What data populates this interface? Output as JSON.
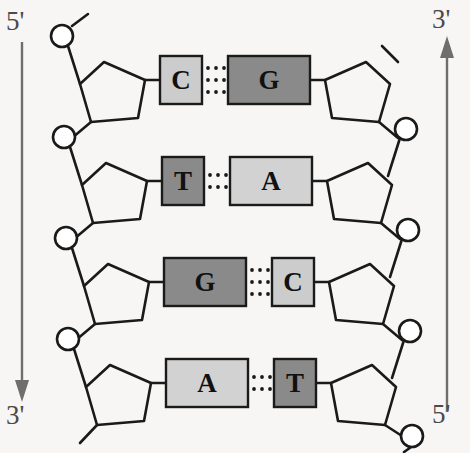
{
  "diagram": {
    "type": "dna-antiparallel-strands",
    "background_color": "#f7f6f4",
    "line_color": "#1a1a1a",
    "arrow_color": "#6e6e6e"
  },
  "labels": {
    "left_top": "5'",
    "left_bottom": "3'",
    "right_top": "3'",
    "right_bottom": "5'"
  },
  "strands": {
    "left": {
      "name": "left-strand",
      "direction": "5-prime-to-3-prime-downward",
      "arrow": "down",
      "top_label": "5'",
      "bottom_label": "3'"
    },
    "right": {
      "name": "right-strand",
      "direction": "5-prime-to-3-prime-upward",
      "arrow": "up",
      "top_label": "3'",
      "bottom_label": "5'"
    }
  },
  "colors": {
    "purine_fill_dark": "#8a8a8a",
    "purine_fill_light": "#d2d2d2",
    "pyrimidine_fill_dark": "#8a8a8a",
    "pyrimidine_fill_light": "#cccccc",
    "box_stroke": "#1a1a1a",
    "text_color": "#111111"
  },
  "base_pairs": [
    {
      "index": 1,
      "left": {
        "base": "C",
        "kind": "pyrimidine",
        "shade": "light",
        "fill": "#cccccc"
      },
      "right": {
        "base": "G",
        "kind": "purine",
        "shade": "dark",
        "fill": "#8a8a8a"
      },
      "hydrogen_bonds": 3
    },
    {
      "index": 2,
      "left": {
        "base": "T",
        "kind": "pyrimidine",
        "shade": "dark",
        "fill": "#8a8a8a"
      },
      "right": {
        "base": "A",
        "kind": "purine",
        "shade": "light",
        "fill": "#d2d2d2"
      },
      "hydrogen_bonds": 2
    },
    {
      "index": 3,
      "left": {
        "base": "G",
        "kind": "purine",
        "shade": "dark",
        "fill": "#8a8a8a"
      },
      "right": {
        "base": "C",
        "kind": "pyrimidine",
        "shade": "light",
        "fill": "#cccccc"
      },
      "hydrogen_bonds": 3
    },
    {
      "index": 4,
      "left": {
        "base": "A",
        "kind": "purine",
        "shade": "light",
        "fill": "#d2d2d2"
      },
      "right": {
        "base": "T",
        "kind": "pyrimidine",
        "shade": "dark",
        "fill": "#8a8a8a"
      },
      "hydrogen_bonds": 2
    }
  ],
  "components": {
    "phosphate": "circle",
    "sugar": "pentagon",
    "base": "rectangle",
    "hydrogen_bond": "dotted-line"
  }
}
